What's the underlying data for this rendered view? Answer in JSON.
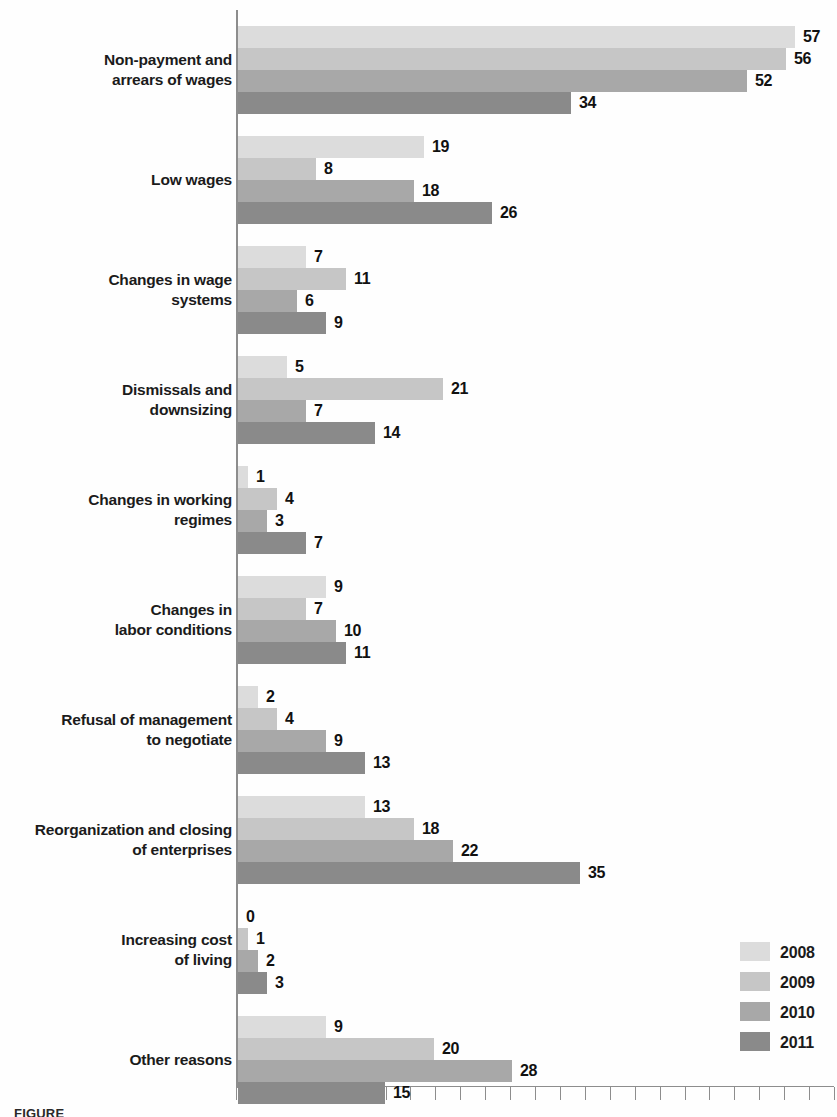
{
  "chart_data": {
    "type": "bar",
    "orientation": "horizontal",
    "title": "",
    "xlabel": "",
    "ylabel": "",
    "grid": false,
    "xlim": [
      0,
      60
    ],
    "axis_tick_step": 2.5,
    "axis_tick_count": 24,
    "legend_position": "bottom-right",
    "categories": [
      "Non-payment and arrears of wages",
      "Low wages",
      "Changes in wage systems",
      "Dismissals and downsizing",
      "Changes in working regimes",
      "Changes in labor conditions",
      "Refusal of management to negotiate",
      "Reorganization and closing of enterprises",
      "Increasing cost of living",
      "Other reasons"
    ],
    "series": [
      {
        "name": "2008",
        "color": "#dcdcdc",
        "values": [
          57,
          19,
          7,
          5,
          1,
          9,
          2,
          13,
          0,
          9
        ]
      },
      {
        "name": "2009",
        "color": "#c6c6c6",
        "values": [
          56,
          8,
          11,
          21,
          4,
          7,
          4,
          18,
          1,
          20
        ]
      },
      {
        "name": "2010",
        "color": "#a8a8a8",
        "values": [
          52,
          18,
          6,
          7,
          3,
          10,
          9,
          22,
          2,
          28
        ]
      },
      {
        "name": "2011",
        "color": "#8a8a8a",
        "values": [
          34,
          26,
          9,
          14,
          7,
          11,
          13,
          35,
          3,
          15
        ]
      }
    ]
  },
  "groups": [
    {
      "label_lines": [
        "Non-payment and",
        "arrears of wages"
      ],
      "values": [
        57,
        56,
        52,
        34
      ]
    },
    {
      "label_lines": [
        "Low wages"
      ],
      "values": [
        19,
        8,
        18,
        26
      ]
    },
    {
      "label_lines": [
        "Changes in wage",
        "systems"
      ],
      "values": [
        7,
        11,
        6,
        9
      ]
    },
    {
      "label_lines": [
        "Dismissals and",
        "downsizing"
      ],
      "values": [
        5,
        21,
        7,
        14
      ]
    },
    {
      "label_lines": [
        "Changes in working",
        "regimes"
      ],
      "values": [
        1,
        4,
        3,
        7
      ]
    },
    {
      "label_lines": [
        "Changes in",
        "labor conditions"
      ],
      "values": [
        9,
        7,
        10,
        11
      ]
    },
    {
      "label_lines": [
        "Refusal of management",
        "to negotiate"
      ],
      "values": [
        2,
        4,
        9,
        13
      ]
    },
    {
      "label_lines": [
        "Reorganization and closing",
        "of enterprises"
      ],
      "values": [
        13,
        18,
        22,
        35
      ]
    },
    {
      "label_lines": [
        "Increasing cost",
        "of living"
      ],
      "values": [
        0,
        1,
        2,
        3
      ]
    },
    {
      "label_lines": [
        "Other reasons"
      ],
      "values": [
        9,
        20,
        28,
        15
      ]
    }
  ],
  "legend": {
    "items": [
      {
        "label": "2008",
        "color": "#dcdcdc"
      },
      {
        "label": "2009",
        "color": "#c6c6c6"
      },
      {
        "label": "2010",
        "color": "#a8a8a8"
      },
      {
        "label": "2011",
        "color": "#8a8a8a"
      }
    ]
  },
  "caption": "FIGURE"
}
